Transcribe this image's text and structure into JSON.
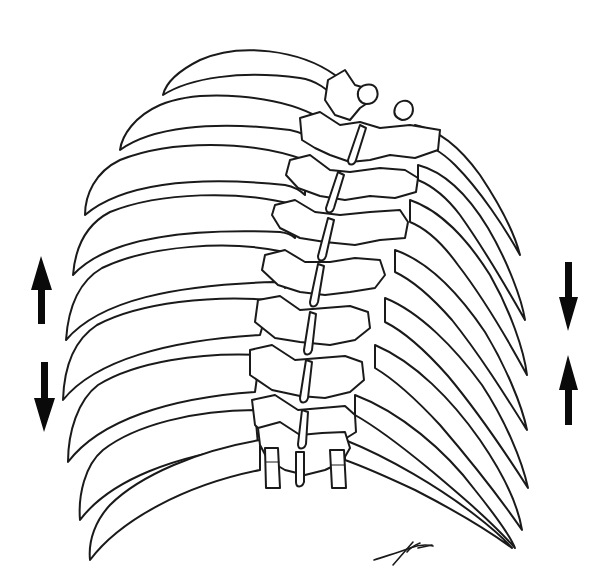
{
  "figure": {
    "colors": {
      "line": "#1a1a1a",
      "background": "#ffffff",
      "arrow": "#0a0a0a"
    }
  },
  "arrows": {
    "left": [
      {
        "direction": "up",
        "icon": "arrow-up-icon"
      },
      {
        "direction": "down",
        "icon": "arrow-down-icon"
      }
    ],
    "right": [
      {
        "direction": "down",
        "icon": "arrow-down-icon"
      },
      {
        "direction": "up",
        "icon": "arrow-up-icon"
      }
    ]
  },
  "signature": {
    "icon": "artist-signature"
  }
}
